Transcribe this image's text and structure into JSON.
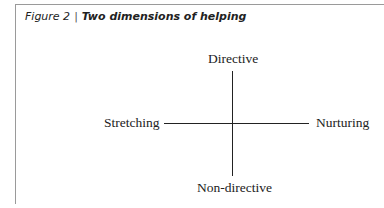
{
  "figure": {
    "number_label": "Figure 2",
    "separator": "|",
    "title": "Two dimensions of helping"
  },
  "diagram": {
    "type": "quadrant-axes",
    "top_label": "Directive",
    "bottom_label": "Non-directive",
    "left_label": "Stretching",
    "right_label": "Nurturing"
  }
}
